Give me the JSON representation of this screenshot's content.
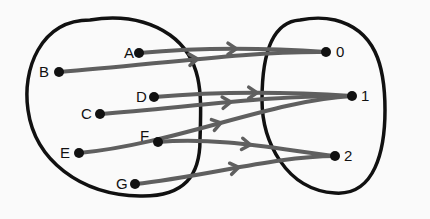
{
  "diagram": {
    "type": "mapping",
    "domain_set": {
      "name": "domain",
      "elements": [
        "A",
        "B",
        "C",
        "D",
        "E",
        "F",
        "G"
      ]
    },
    "codomain_set": {
      "name": "codomain",
      "elements": [
        "0",
        "1",
        "2"
      ]
    },
    "mappings": [
      {
        "from": "A",
        "to": "0"
      },
      {
        "from": "B",
        "to": "0"
      },
      {
        "from": "C",
        "to": "1"
      },
      {
        "from": "D",
        "to": "1"
      },
      {
        "from": "E",
        "to": "1"
      },
      {
        "from": "F",
        "to": "2"
      },
      {
        "from": "G",
        "to": "2"
      }
    ],
    "colors": {
      "arrow": "#5f5f5f",
      "outline": "#111111",
      "dot": "#111111",
      "background": "#fafafa"
    }
  }
}
